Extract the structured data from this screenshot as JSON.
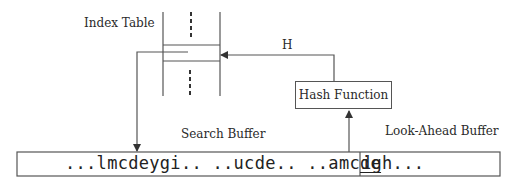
{
  "diagram": {
    "title_labels": {
      "index_table": "Index Table",
      "hash_output": "H",
      "hash_function": "Hash Function",
      "search_buffer": "Search Buffer",
      "lookahead_buffer": "Look-Ahead Buffer"
    },
    "buffer": {
      "search_part_prefix": "...lmcdeygi.. ..ucde.. ..amc",
      "search_part_underlined": "de",
      "lookahead_part": "igh..."
    },
    "colors": {
      "line": "#555555",
      "text": "#2a2a2a"
    }
  }
}
